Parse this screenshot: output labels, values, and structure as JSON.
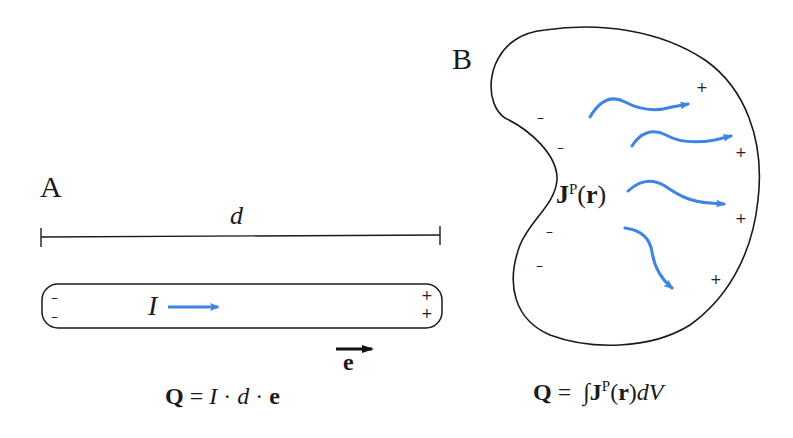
{
  "colors": {
    "stroke": "#1a1a1a",
    "arrow_blue": "#3f84e0",
    "background": "#ffffff"
  },
  "panel_a": {
    "label": "A",
    "length_symbol": "d",
    "current_symbol": "I",
    "left_charges": [
      "–",
      "–"
    ],
    "right_charges": [
      "+",
      "+"
    ],
    "unit_vector_symbol": "e",
    "equation": {
      "lhs": "Q",
      "eq": " = ",
      "term1": "I",
      "dot1": " · ",
      "term2": "d",
      "dot2": " · ",
      "term3": "e"
    }
  },
  "panel_b": {
    "label": "B",
    "field_symbol": "J",
    "field_superscript": "P",
    "field_arg": "(r)",
    "field_arg_open": "(",
    "field_arg_var": "r",
    "field_arg_close": ")",
    "left_charges": [
      "–",
      "–",
      "–",
      "–"
    ],
    "right_charges": [
      "+",
      "+",
      "+",
      "+"
    ],
    "equation": {
      "lhs": "Q",
      "eq": " =  ",
      "integral": "∫",
      "J": "J",
      "sup": "P",
      "open": "(",
      "r": "r",
      "close": ")",
      "dV": "dV"
    }
  }
}
